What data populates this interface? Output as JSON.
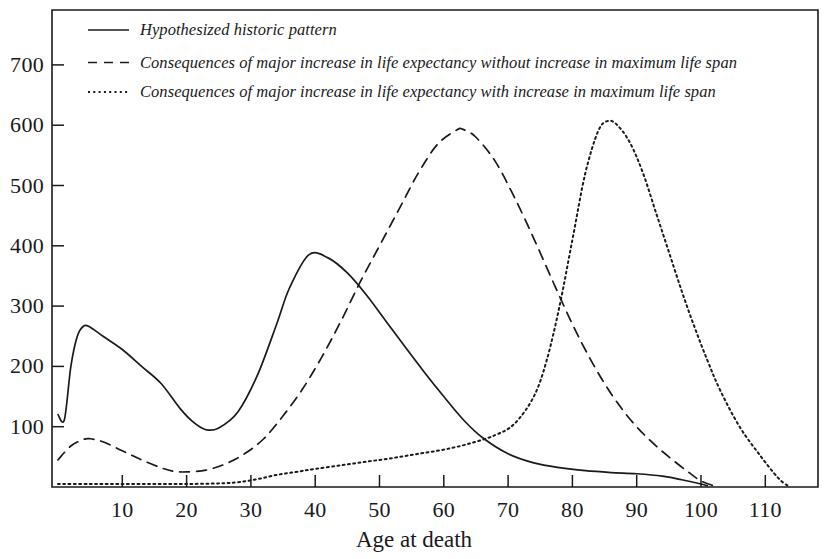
{
  "chart_data": {
    "type": "line",
    "title": "",
    "xlabel": "Age at death",
    "ylabel": "",
    "xlim": [
      -1,
      118.5
    ],
    "ylim": [
      0,
      760
    ],
    "grid": false,
    "legend_position": "top-left-inside",
    "x_ticks": [
      10,
      20,
      30,
      40,
      50,
      60,
      70,
      80,
      90,
      100,
      110
    ],
    "y_ticks": [
      100,
      200,
      300,
      400,
      500,
      600,
      700
    ],
    "series": [
      {
        "name": "Hypothesized historic pattern",
        "style": "solid",
        "x": [
          0,
          1,
          2,
          3,
          4,
          5,
          7,
          10,
          13,
          16,
          19,
          21,
          23,
          25,
          28,
          31,
          34,
          36,
          39,
          42,
          45,
          48,
          51,
          54,
          57,
          60,
          63,
          66,
          70,
          74,
          78,
          82,
          86,
          90,
          94,
          97,
          100,
          101
        ],
        "values": [
          120,
          112,
          200,
          250,
          267,
          265,
          250,
          228,
          200,
          172,
          130,
          108,
          95,
          98,
          125,
          185,
          270,
          330,
          385,
          380,
          355,
          318,
          275,
          232,
          190,
          150,
          112,
          82,
          55,
          40,
          32,
          27,
          24,
          22,
          18,
          12,
          5,
          2
        ]
      },
      {
        "name": "Consequences of major increase in life expectancy without increase in maximum life span",
        "style": "dashed",
        "x": [
          0,
          2,
          4,
          5,
          7,
          10,
          13,
          16,
          18,
          20,
          23,
          26,
          29,
          32,
          35,
          38,
          41,
          44,
          47,
          50,
          53,
          56,
          59,
          62,
          63,
          65,
          68,
          71,
          74,
          77,
          80,
          83,
          86,
          89,
          92,
          95,
          98,
          100,
          102
        ],
        "values": [
          45,
          68,
          79,
          80,
          75,
          60,
          45,
          32,
          26,
          25,
          28,
          38,
          55,
          80,
          118,
          162,
          215,
          275,
          340,
          400,
          460,
          520,
          568,
          592,
          593,
          580,
          540,
          480,
          412,
          340,
          270,
          208,
          155,
          112,
          78,
          50,
          25,
          10,
          2
        ]
      },
      {
        "name": "Consequences of major increase in life expectancy with increase in maximum life span",
        "style": "dotted",
        "x": [
          0,
          5,
          10,
          15,
          20,
          25,
          28,
          31,
          34,
          37,
          40,
          44,
          48,
          52,
          56,
          60,
          64,
          68,
          71,
          74,
          76,
          78,
          80,
          82,
          84,
          85.5,
          87,
          89,
          91,
          93,
          95,
          97,
          99,
          101,
          103,
          106,
          109,
          112,
          113.5
        ],
        "values": [
          5,
          5,
          5,
          5,
          5,
          6,
          8,
          13,
          20,
          25,
          30,
          36,
          42,
          48,
          55,
          62,
          72,
          86,
          105,
          150,
          210,
          300,
          410,
          520,
          590,
          607,
          600,
          570,
          520,
          455,
          390,
          325,
          265,
          210,
          160,
          100,
          55,
          15,
          2
        ]
      }
    ]
  },
  "legend": {
    "entries": [
      {
        "label": "Hypothesized historic pattern",
        "style": "solid"
      },
      {
        "label": "Consequences of major increase in life expectancy without increase in maximum life span",
        "style": "dashed"
      },
      {
        "label": "Consequences of major increase in life expectancy with increase in maximum life span",
        "style": "dotted"
      }
    ]
  },
  "axes": {
    "x_title": "Age at death",
    "x_tick_labels": [
      "10",
      "20",
      "30",
      "40",
      "50",
      "60",
      "70",
      "80",
      "90",
      "100",
      "110"
    ],
    "y_tick_labels": [
      "700",
      "600",
      "500",
      "400",
      "300",
      "200",
      "100"
    ]
  },
  "colors": {
    "ink": "#1a1a1a",
    "background": "#ffffff"
  }
}
